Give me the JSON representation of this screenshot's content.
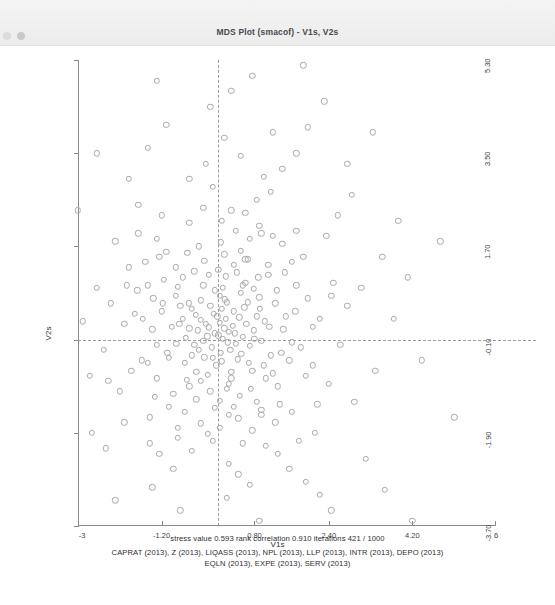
{
  "window": {
    "title": "MDS Plot (smacof) - V1s, V2s",
    "dots": [
      "window-dot-left",
      "window-dot-right"
    ]
  },
  "footer": {
    "stress_line": "stress value  0.593   rank correlation  0.910   iterations  421  /  1000",
    "variables_line_1": "CAPRAT (2013), Z (2013), LIQASS (2013), NPL (2013), LLP (2013), INTR (2013), DEPO (2013)",
    "variables_line_2": "EQLN (2013), EXPE (2013), SERV (2013)"
  },
  "chart_data": {
    "type": "scatter",
    "title": "MDS Plot (smacof) - V1s, V2s",
    "xlabel": "V1s",
    "ylabel": "V2s",
    "xlim": [
      -3,
      6
    ],
    "ylim": [
      -3.7,
      5.3
    ],
    "grid": false,
    "legend": null,
    "xticks": [
      "-3",
      "-1.20",
      "0.80",
      "2.40",
      "4.20",
      "6"
    ],
    "xtickvalues": [
      -3,
      -1.2,
      0.8,
      2.4,
      4.2,
      6
    ],
    "yticks": [
      "5.30",
      "3.50",
      "1.70",
      "-0.10",
      "-1.90",
      "-3.70"
    ],
    "ytickvalues": [
      5.3,
      3.5,
      1.7,
      -0.1,
      -1.9,
      -3.7
    ],
    "reference_lines": {
      "vertical_x": 0.02,
      "horizontal_y": -0.1,
      "style": "dashed",
      "color": "#9d9d9f"
    },
    "marker": {
      "shape": "open-circle",
      "color": "#a9a9ab",
      "size": 4.4
    },
    "annotations": {
      "stress_value": 0.593,
      "rank_correlation": 0.91,
      "iterations": 421,
      "max_iterations": 1000
    },
    "n_points": 281,
    "points": [
      [
        -0.05,
        0.02
      ],
      [
        0.12,
        -0.08
      ],
      [
        -0.18,
        0.14
      ],
      [
        0.05,
        0.22
      ],
      [
        -0.3,
        -0.12
      ],
      [
        0.25,
        0.05
      ],
      [
        -0.12,
        -0.25
      ],
      [
        0.33,
        0.17
      ],
      [
        -0.42,
        0.08
      ],
      [
        0.08,
        -0.35
      ],
      [
        0.18,
        0.3
      ],
      [
        -0.22,
        -0.04
      ],
      [
        0.4,
        -0.18
      ],
      [
        -0.08,
        0.4
      ],
      [
        0.02,
        -0.02
      ],
      [
        -0.35,
        0.28
      ],
      [
        0.28,
        -0.3
      ],
      [
        0.15,
        0.12
      ],
      [
        -0.5,
        -0.2
      ],
      [
        0.47,
        0.33
      ],
      [
        -0.15,
        0.55
      ],
      [
        0.55,
        -0.05
      ],
      [
        -0.6,
        0.12
      ],
      [
        0.1,
        -0.52
      ],
      [
        0.36,
        0.45
      ],
      [
        -0.28,
        -0.44
      ],
      [
        0.62,
        0.2
      ],
      [
        -0.46,
        0.38
      ],
      [
        0.2,
        0.62
      ],
      [
        -0.02,
        -0.6
      ],
      [
        0.7,
        -0.22
      ],
      [
        -0.68,
        -0.06
      ],
      [
        0.44,
        -0.48
      ],
      [
        -0.36,
        0.66
      ],
      [
        0.58,
        0.52
      ],
      [
        -0.55,
        -0.4
      ],
      [
        0.05,
        0.75
      ],
      [
        0.78,
        0.08
      ],
      [
        -0.74,
        0.3
      ],
      [
        0.3,
        -0.72
      ],
      [
        -0.2,
        -0.78
      ],
      [
        0.68,
        -0.55
      ],
      [
        -0.62,
        0.6
      ],
      [
        0.85,
        0.35
      ],
      [
        0.12,
        0.9
      ],
      [
        -0.88,
        -0.18
      ],
      [
        0.5,
        0.8
      ],
      [
        -0.45,
        -0.72
      ],
      [
        0.95,
        -0.12
      ],
      [
        -0.3,
        0.95
      ],
      [
        0.75,
        -0.7
      ],
      [
        -0.8,
        0.55
      ],
      [
        0.25,
        -0.95
      ],
      [
        1.02,
        0.25
      ],
      [
        -0.98,
        0.15
      ],
      [
        0.6,
        1.0
      ],
      [
        -0.66,
        -0.88
      ],
      [
        0.9,
        0.72
      ],
      [
        -1.08,
        -0.35
      ],
      [
        0.18,
        1.12
      ],
      [
        -0.15,
        -1.1
      ],
      [
        1.15,
        -0.4
      ],
      [
        -0.85,
        0.92
      ],
      [
        0.72,
        -1.05
      ],
      [
        -1.2,
        0.45
      ],
      [
        0.42,
        1.2
      ],
      [
        1.25,
        0.6
      ],
      [
        -0.5,
        1.22
      ],
      [
        0.05,
        -1.28
      ],
      [
        -1.3,
        -0.2
      ],
      [
        1.05,
        -0.85
      ],
      [
        -0.95,
        -1.15
      ],
      [
        0.88,
        1.1
      ],
      [
        -1.38,
        0.7
      ],
      [
        0.35,
        -1.4
      ],
      [
        1.42,
        0.1
      ],
      [
        -0.28,
        1.42
      ],
      [
        -1.15,
        1.05
      ],
      [
        1.3,
        -1.0
      ],
      [
        0.6,
        1.45
      ],
      [
        -1.5,
        -0.55
      ],
      [
        0.15,
        1.55
      ],
      [
        1.55,
        -0.5
      ],
      [
        -0.7,
        -1.5
      ],
      [
        1.1,
        1.35
      ],
      [
        -1.6,
        0.3
      ],
      [
        0.45,
        -1.62
      ],
      [
        -1.35,
        -1.2
      ],
      [
        1.68,
        0.45
      ],
      [
        -0.4,
        1.7
      ],
      [
        0.95,
        -1.55
      ],
      [
        -1.72,
        0.85
      ],
      [
        1.45,
        1.2
      ],
      [
        0.05,
        -1.8
      ],
      [
        -1.1,
        1.6
      ],
      [
        1.8,
        -0.25
      ],
      [
        -1.85,
        -0.7
      ],
      [
        0.7,
        1.85
      ],
      [
        1.25,
        -1.7
      ],
      [
        -0.2,
        -1.92
      ],
      [
        -1.55,
        1.4
      ],
      [
        1.95,
        0.7
      ],
      [
        0.4,
        2.0
      ],
      [
        -2.0,
        0.2
      ],
      [
        1.6,
        -1.5
      ],
      [
        -0.85,
        -2.0
      ],
      [
        2.05,
        -0.6
      ],
      [
        -1.3,
        1.85
      ],
      [
        0.9,
        2.1
      ],
      [
        -2.1,
        -1.1
      ],
      [
        1.4,
        1.75
      ],
      [
        0.1,
        2.2
      ],
      [
        -0.55,
        -2.25
      ],
      [
        2.2,
        0.3
      ],
      [
        -1.9,
        1.3
      ],
      [
        1.05,
        -2.15
      ],
      [
        -2.3,
        0.6
      ],
      [
        0.6,
        2.35
      ],
      [
        1.85,
        1.5
      ],
      [
        -1.45,
        -2.1
      ],
      [
        2.4,
        -0.95
      ],
      [
        -0.3,
        2.45
      ],
      [
        1.3,
        -2.3
      ],
      [
        -2.45,
        -0.3
      ],
      [
        0.25,
        -2.5
      ],
      [
        2.5,
        1.0
      ],
      [
        -2.0,
        -1.7
      ],
      [
        0.85,
        2.6
      ],
      [
        -1.2,
        2.3
      ],
      [
        1.7,
        2.0
      ],
      [
        2.65,
        -0.2
      ],
      [
        -2.6,
        0.9
      ],
      [
        0.45,
        -2.7
      ],
      [
        -0.95,
        -2.6
      ],
      [
        2.1,
        -1.9
      ],
      [
        -2.2,
        1.8
      ],
      [
        1.15,
        2.75
      ],
      [
        -0.1,
        2.85
      ],
      [
        2.8,
        0.55
      ],
      [
        -2.75,
        -0.8
      ],
      [
        1.55,
        -2.6
      ],
      [
        0.7,
        -2.9
      ],
      [
        -1.7,
        2.5
      ],
      [
        2.95,
        -1.3
      ],
      [
        -0.6,
        3.0
      ],
      [
        2.35,
        1.9
      ],
      [
        -2.9,
        0.25
      ],
      [
        1.0,
        3.05
      ],
      [
        -1.4,
        -2.95
      ],
      [
        3.1,
        0.9
      ],
      [
        0.2,
        -3.15
      ],
      [
        -2.4,
        -2.2
      ],
      [
        1.9,
        -2.85
      ],
      [
        -0.25,
        3.3
      ],
      [
        2.6,
        2.3
      ],
      [
        -3.2,
        1.2
      ],
      [
        1.4,
        3.2
      ],
      [
        0.5,
        3.45
      ],
      [
        -1.9,
        3.0
      ],
      [
        3.4,
        -0.7
      ],
      [
        -2.7,
        -1.9
      ],
      [
        2.2,
        -3.1
      ],
      [
        -0.8,
        -3.4
      ],
      [
        1.7,
        3.5
      ],
      [
        3.55,
        1.5
      ],
      [
        -3.5,
        -0.4
      ],
      [
        0.9,
        -3.6
      ],
      [
        -1.5,
        3.6
      ],
      [
        2.9,
        2.7
      ],
      [
        -3.0,
        2.4
      ],
      [
        0.15,
        3.8
      ],
      [
        3.8,
        0.3
      ],
      [
        -2.2,
        -3.2
      ],
      [
        2.45,
        -3.4
      ],
      [
        1.2,
        3.9
      ],
      [
        -3.9,
        0.8
      ],
      [
        -0.5,
        -3.95
      ],
      [
        3.2,
        -2.4
      ],
      [
        1.95,
        4.0
      ],
      [
        -1.1,
        4.05
      ],
      [
        -3.3,
        -2.6
      ],
      [
        4.1,
        1.1
      ],
      [
        0.55,
        -4.2
      ],
      [
        2.8,
        3.3
      ],
      [
        -2.6,
        3.5
      ],
      [
        -4.2,
        -1.4
      ],
      [
        3.6,
        -3.0
      ],
      [
        1.5,
        -4.3
      ],
      [
        -0.15,
        4.4
      ],
      [
        4.4,
        -0.5
      ],
      [
        -1.8,
        -4.2
      ],
      [
        2.3,
        4.5
      ],
      [
        -3.7,
        2.9
      ],
      [
        0.3,
        4.7
      ],
      [
        -4.5,
        0.4
      ],
      [
        3.9,
        2.2
      ],
      [
        -2.9,
        -3.8
      ],
      [
        1.05,
        -4.8
      ],
      [
        4.8,
        1.8
      ],
      [
        -1.3,
        4.9
      ],
      [
        2.65,
        -4.5
      ],
      [
        -4.8,
        -2.1
      ],
      [
        0.75,
        5.0
      ],
      [
        3.35,
        3.9
      ],
      [
        -3.4,
        4.1
      ],
      [
        -0.6,
        -5.1
      ],
      [
        5.1,
        -1.6
      ],
      [
        1.85,
        5.2
      ],
      [
        -2.3,
        -5.0
      ],
      [
        4.2,
        -3.6
      ],
      [
        -5.2,
        1.3
      ],
      [
        0.0,
        0.35
      ],
      [
        0.1,
        0.5
      ],
      [
        -0.1,
        -0.45
      ],
      [
        0.22,
        -0.15
      ],
      [
        -0.25,
        0.2
      ],
      [
        0.38,
        0.02
      ],
      [
        -0.4,
        -0.3
      ],
      [
        0.16,
        0.68
      ],
      [
        -0.55,
        0.5
      ],
      [
        0.52,
        -0.38
      ],
      [
        -0.7,
        -0.55
      ],
      [
        0.65,
        0.62
      ],
      [
        -0.05,
        0.85
      ],
      [
        0.8,
        -0.08
      ],
      [
        -0.82,
        0.2
      ],
      [
        0.3,
        -0.85
      ],
      [
        -0.35,
        -0.9
      ],
      [
        0.92,
        0.5
      ],
      [
        -0.9,
        0.75
      ],
      [
        0.55,
        0.95
      ],
      [
        -0.6,
        -1.0
      ],
      [
        1.0,
        -0.6
      ],
      [
        0.2,
        -1.05
      ],
      [
        -1.05,
        -0.45
      ],
      [
        0.78,
        0.88
      ],
      [
        -0.75,
        1.1
      ],
      [
        1.12,
        0.15
      ],
      [
        -0.18,
        1.15
      ],
      [
        0.48,
        -1.18
      ],
      [
        -1.18,
        0.6
      ],
      [
        1.2,
        -0.75
      ],
      [
        0.02,
        1.25
      ],
      [
        -0.45,
        -1.25
      ],
      [
        1.28,
        0.85
      ],
      [
        -1.3,
        -0.85
      ],
      [
        0.85,
        -1.3
      ],
      [
        -0.9,
        1.3
      ],
      [
        0.35,
        1.35
      ],
      [
        1.38,
        -0.35
      ],
      [
        -1.4,
        0.1
      ],
      [
        -0.05,
        -1.42
      ],
      [
        0.65,
        1.45
      ],
      [
        1.48,
        0.35
      ],
      [
        -1.05,
        -1.4
      ],
      [
        1.1,
        1.15
      ],
      [
        -1.5,
        0.95
      ],
      [
        0.25,
        -1.55
      ],
      [
        -0.65,
        1.58
      ],
      [
        1.6,
        -0.15
      ],
      [
        0.95,
        -1.45
      ],
      [
        -1.62,
        -0.5
      ],
      [
        0.5,
        1.62
      ],
      [
        -1.25,
        1.5
      ],
      [
        1.7,
        0.95
      ],
      [
        -0.35,
        -1.72
      ],
      [
        1.35,
        -1.35
      ],
      [
        0.08,
        1.78
      ],
      [
        -1.78,
        0.4
      ],
      [
        0.75,
        -1.85
      ],
      [
        -0.85,
        -1.8
      ],
      [
        1.9,
        -0.8
      ],
      [
        -1.45,
        -1.6
      ],
      [
        1.2,
        1.9
      ],
      [
        -0.1,
        -2.05
      ],
      [
        2.05,
        0.15
      ],
      [
        0.55,
        -2.1
      ],
      [
        -1.95,
        0.95
      ],
      [
        1.6,
        1.4
      ],
      [
        -0.6,
        2.15
      ],
      [
        2.15,
        -1.35
      ],
      [
        -1.25,
        -2.3
      ],
      [
        0.3,
        2.4
      ],
      [
        -2.35,
        -0.9
      ],
      [
        1.75,
        -2.05
      ],
      [
        0.95,
        1.95
      ],
      [
        -1.7,
        1.95
      ],
      [
        2.45,
        0.75
      ]
    ]
  }
}
